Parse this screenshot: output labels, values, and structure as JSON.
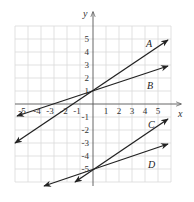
{
  "figure": {
    "axes": {
      "x_label": "x",
      "y_label": "y",
      "x_range": [
        -6,
        6
      ],
      "y_range": [
        -6,
        6
      ]
    },
    "x_ticks": [
      "-5",
      "-4",
      "-3",
      "-2",
      "-1",
      "1",
      "2",
      "3",
      "4",
      "5"
    ],
    "y_ticks": [
      "5",
      "4",
      "3",
      "2",
      "1",
      "-1",
      "-2",
      "-3",
      "-4",
      "-5"
    ],
    "lines": [
      {
        "name": "A",
        "equation": "y = (2/3)x + 1"
      },
      {
        "name": "B",
        "equation": "y = (1/3)x + 1"
      },
      {
        "name": "C",
        "equation": "y = (2/3)x - 5"
      },
      {
        "name": "D",
        "equation": "y = (1/3)x - 5"
      }
    ],
    "colors": {
      "lines": "#222222",
      "grid": "#d9d9d9",
      "axes": "#555555"
    }
  }
}
